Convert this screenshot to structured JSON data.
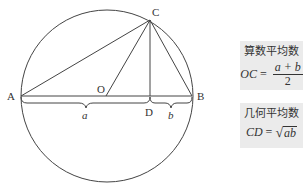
{
  "diagram": {
    "points": {
      "A": {
        "label": "A",
        "x": 21,
        "y": 96
      },
      "B": {
        "label": "B",
        "x": 192,
        "y": 96
      },
      "C": {
        "label": "C",
        "x": 150,
        "y": 20
      },
      "O": {
        "label": "O",
        "x": 106,
        "y": 96
      },
      "D": {
        "label": "D",
        "x": 150,
        "y": 96
      }
    },
    "circle": {
      "cx": 107,
      "cy": 96,
      "r": 86
    },
    "segments": [
      "AB",
      "AC",
      "BC",
      "OC",
      "CD"
    ],
    "braces": [
      {
        "label": "a",
        "from": "A",
        "to": "D"
      },
      {
        "label": "b",
        "from": "D",
        "to": "B"
      }
    ],
    "colors": {
      "stroke": "#444444",
      "box_bg": "#ebebeb",
      "text": "#333333"
    }
  },
  "boxes": {
    "arithmetic": {
      "title": "算数平均数",
      "lhs": "OC",
      "eq": "=",
      "numerator": "a + b",
      "denominator": "2"
    },
    "geometric": {
      "title": "几何平均数",
      "lhs": "CD",
      "eq": "=",
      "radical": "√",
      "radicand": "ab"
    }
  }
}
